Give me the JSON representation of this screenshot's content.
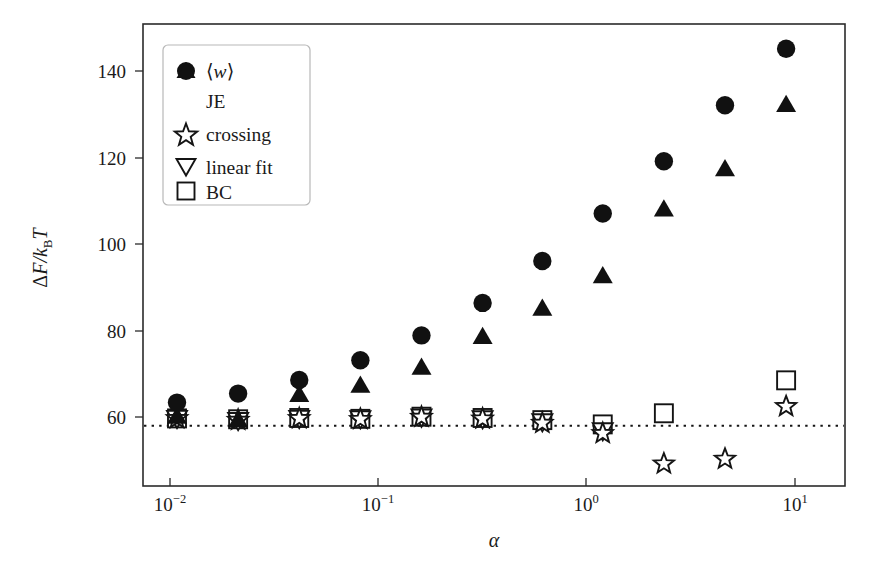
{
  "figure": {
    "background": "#ffffff",
    "frame_color": "#2b2b2b",
    "marker_color": "#111111"
  },
  "chart_data": {
    "type": "scatter",
    "title": "",
    "xlabel": "α",
    "ylabel": "ΔF/k_BT",
    "xscale": "log",
    "yscale": "linear",
    "xlim": [
      0.0068,
      19.5
    ],
    "ylim": [
      44,
      152
    ],
    "grid": false,
    "legend_position": "upper left",
    "xticks": [
      0.01,
      0.1,
      1,
      10
    ],
    "xtick_labels": [
      "10⁻²",
      "10⁻¹",
      "10⁰",
      "10¹"
    ],
    "yticks": [
      60,
      80,
      100,
      120,
      140
    ],
    "ytick_labels": [
      "60",
      "80",
      "100",
      "120",
      "140"
    ],
    "reference_line": {
      "label": "equilibrium free energy",
      "style": "dotted",
      "y": 59.6
    },
    "x": [
      0.01,
      0.02,
      0.04,
      0.08,
      0.16,
      0.32,
      0.63,
      1.25,
      2.5,
      5.0,
      10.0
    ],
    "series": [
      {
        "name": "⟨w⟩",
        "marker": "circle-filled",
        "values": [
          63.5,
          65.6,
          68.8,
          73.4,
          79.2,
          86.8,
          96.6,
          107.7,
          119.9,
          133.0,
          146.2
        ]
      },
      {
        "name": "JE",
        "marker": "triangle-up-filled",
        "values": [
          60.3,
          59.5,
          65.4,
          67.6,
          71.8,
          79.0,
          85.6,
          93.2,
          108.8,
          118.2,
          133.2
        ]
      },
      {
        "name": "crossing",
        "marker": "star-open",
        "values": [
          59.8,
          59.4,
          59.8,
          59.6,
          60.1,
          59.7,
          58.7,
          56.3,
          49.2,
          50.3,
          62.6
        ]
      },
      {
        "name": "linear fit",
        "marker": "triangle-down-open",
        "values": [
          59.7,
          59.2,
          59.7,
          59.6,
          60.0,
          59.6,
          58.9,
          56.8,
          null,
          null,
          null
        ]
      },
      {
        "name": "BC",
        "marker": "square-open",
        "values": [
          59.8,
          59.6,
          59.9,
          59.7,
          60.2,
          59.9,
          59.4,
          58.4,
          61.0,
          null,
          68.7
        ]
      }
    ]
  },
  "legend": {
    "items": [
      {
        "marker": "circle-filled",
        "label": "⟨w⟩",
        "label_italic_part": "w"
      },
      {
        "marker": "triangle-up-filled",
        "label": "JE"
      },
      {
        "marker": "star-open",
        "label": "crossing"
      },
      {
        "marker": "triangle-down-open",
        "label": "linear fit"
      },
      {
        "marker": "square-open",
        "label": "BC"
      }
    ]
  },
  "axes": {
    "x_title": "α",
    "y_title_main": "ΔF/k",
    "y_title_sub": "B",
    "y_title_tail": "T",
    "x_tick_0_base": "10",
    "x_tick_0_exp": "−2",
    "x_tick_1_base": "10",
    "x_tick_1_exp": "−1",
    "x_tick_2_base": "10",
    "x_tick_2_exp": "0",
    "x_tick_3_base": "10",
    "x_tick_3_exp": "1",
    "y_tick_0": "60",
    "y_tick_1": "80",
    "y_tick_2": "100",
    "y_tick_3": "120",
    "y_tick_4": "140"
  }
}
